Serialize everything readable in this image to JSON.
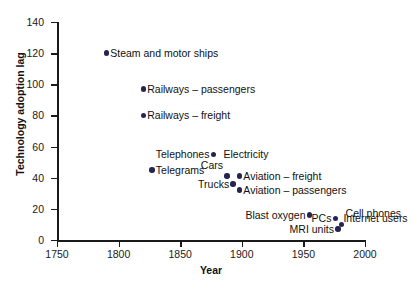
{
  "chart_data": {
    "type": "scatter",
    "title": "",
    "xlabel": "Year",
    "ylabel": "Technology adoption lag",
    "xlim": [
      1750,
      2000
    ],
    "ylim": [
      0,
      140
    ],
    "grid": false,
    "legend": "none",
    "xticks": [
      "1750",
      "1800",
      "1850",
      "1900",
      "1950",
      "2000"
    ],
    "xtick_values": [
      1750,
      1800,
      1850,
      1900,
      1950,
      2000
    ],
    "yticks": [
      "0",
      "20",
      "40",
      "60",
      "80",
      "100",
      "120",
      "140"
    ],
    "ytick_values": [
      0,
      20,
      40,
      60,
      80,
      100,
      120,
      140
    ],
    "point_color": "#252550",
    "axis_color": "#1a1a1a",
    "points": [
      {
        "label": "Steam and motor ships",
        "x": 1790,
        "y": 120,
        "label_side": "right"
      },
      {
        "label": "Railways – passengers",
        "x": 1820,
        "y": 97,
        "label_side": "right"
      },
      {
        "label": "Railways – freight",
        "x": 1820,
        "y": 80,
        "label_side": "right"
      },
      {
        "label": "Telephones",
        "x": 1877,
        "y": 55,
        "label_side": "left"
      },
      {
        "label": "Electricity",
        "x": 1877,
        "y": 55,
        "label_side": "right",
        "hide_dot": true,
        "label_dx": 6
      },
      {
        "label": "Telegrams",
        "x": 1827,
        "y": 45,
        "label_side": "right"
      },
      {
        "label": "Cars",
        "x": 1888,
        "y": 41,
        "label_side": "left",
        "label_dy": -11
      },
      {
        "label": "Trucks",
        "x": 1893,
        "y": 36,
        "label_side": "left"
      },
      {
        "label": "Aviation – freight",
        "x": 1898,
        "y": 41,
        "label_side": "right"
      },
      {
        "label": "Aviation – passengers",
        "x": 1898,
        "y": 32,
        "label_side": "right"
      },
      {
        "label": "Blast oxygen",
        "x": 1955,
        "y": 16,
        "label_side": "left"
      },
      {
        "label": "PCs",
        "x": 1976,
        "y": 14,
        "label_side": "left"
      },
      {
        "label": "Cell phones",
        "x": 1981,
        "y": 10,
        "label_side": "right",
        "label_dy": -11
      },
      {
        "label": "Internet users",
        "x": 1976,
        "y": 14,
        "label_side": "right",
        "hide_dot": true,
        "label_dx": 4
      },
      {
        "label": "MRI units",
        "x": 1978,
        "y": 7,
        "label_side": "left"
      }
    ]
  }
}
